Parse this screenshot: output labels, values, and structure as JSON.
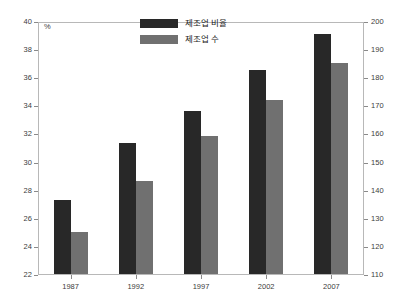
{
  "chart_data": {
    "type": "bar",
    "title": "",
    "subtitle": "",
    "categories": [
      "1987",
      "1992",
      "1997",
      "2002",
      "2007"
    ],
    "series": [
      {
        "name": "제조업 비율",
        "axis": "left",
        "color": "#282828",
        "values": [
          27.3,
          31.3,
          33.6,
          36.5,
          39.1
        ]
      },
      {
        "name": "제조업 수",
        "axis": "right",
        "color": "#707070",
        "values": [
          125,
          143,
          159,
          172,
          185
        ]
      }
    ],
    "xlabel": "",
    "ylabel": "%",
    "ylabel_right": "",
    "ylim": [
      22,
      40
    ],
    "ylim_right": [
      110,
      200
    ],
    "yticks": [
      22,
      24,
      26,
      28,
      30,
      32,
      34,
      36,
      38,
      40
    ],
    "yticks_right": [
      110,
      120,
      130,
      140,
      150,
      160,
      170,
      180,
      190,
      200
    ],
    "grid": false,
    "legend_position": "top-center",
    "frame_color": "#b8b8b8",
    "background": "#ffffff"
  },
  "axes": {
    "left_unit": "%",
    "left_ticks": [
      "22",
      "24",
      "26",
      "28",
      "30",
      "32",
      "34",
      "36",
      "38",
      "40"
    ],
    "right_ticks": [
      "110",
      "120",
      "130",
      "140",
      "150",
      "160",
      "170",
      "180",
      "190",
      "200"
    ],
    "x_ticks": [
      "1987",
      "1992",
      "1997",
      "2002",
      "2007"
    ]
  },
  "legend": {
    "items": [
      {
        "label": "제조업 비율",
        "color": "#282828"
      },
      {
        "label": "제조업 수",
        "color": "#707070"
      }
    ]
  }
}
